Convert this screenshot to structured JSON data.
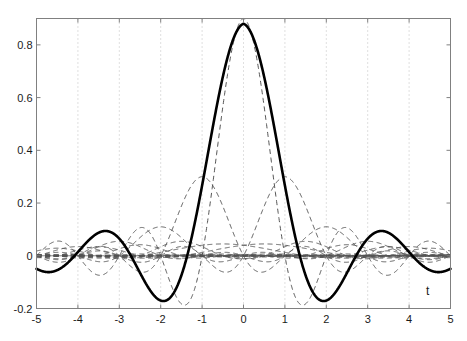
{
  "figure": {
    "background_color": "#ffffff",
    "width": 467,
    "height": 341
  },
  "chart_data": {
    "type": "line",
    "title": "",
    "subtitle": "",
    "xlabel": "t",
    "ylabel": "",
    "xlim": [
      -5,
      5
    ],
    "ylim": [
      -0.2,
      0.9
    ],
    "grid": true,
    "grid_style": "dotted",
    "grid_color": "#b0b0b0",
    "legend": null,
    "legend_position": "none",
    "axis_color": "#808080",
    "xticks": [
      -5,
      -4,
      -3,
      -2,
      -1,
      0,
      1,
      2,
      3,
      4,
      5
    ],
    "xtick_labels": [
      "-5",
      "-4",
      "-3",
      "-2",
      "-1",
      "0",
      "1",
      "2",
      "3",
      "4",
      "5"
    ],
    "yticks": [
      -0.2,
      0,
      0.2,
      0.4,
      0.6,
      0.8
    ],
    "ytick_labels": [
      "-0.2",
      "0",
      "0.2",
      "0.4",
      "0.6",
      "0.8"
    ],
    "annotations": [
      {
        "text": "t",
        "x": 4.45,
        "y": -0.135,
        "name": "x-axis-title"
      }
    ],
    "series": [
      {
        "name": "main-scaling-function",
        "style": "solid",
        "color": "#000000",
        "width": 2.6,
        "description": "Thick solid sinc-like scaling function, peak 0.88 at t=0, zero crossings near t=+-1.35, minima -0.16 at t=+-1.95, secondary maxima 0.063 at t=+-3.25",
        "peak_value": 0.88,
        "peak_x": 0,
        "minima": [
          {
            "x": -1.95,
            "y": -0.16
          },
          {
            "x": 1.95,
            "y": -0.16
          }
        ],
        "secondary_maxima": [
          {
            "x": -3.25,
            "y": 0.063
          },
          {
            "x": 3.25,
            "y": 0.063
          }
        ],
        "params": {
          "A": 0.88,
          "f": 0.672,
          "decay": 1.0
        }
      },
      {
        "name": "component-shift-0",
        "style": "dashed",
        "color": "#555555",
        "width": 1.0,
        "description": "Dashed sinc component centered at t=0, amplitude 0.90",
        "params": {
          "A": 0.9,
          "center": 0,
          "f": 1.0
        }
      },
      {
        "name": "component-shift-minus1",
        "style": "dashed",
        "color": "#555555",
        "width": 1.0,
        "description": "Dashed sinc component centered at t=-1, amplitude 0.30",
        "params": {
          "A": 0.3,
          "center": -1,
          "f": 1.0
        }
      },
      {
        "name": "component-shift-plus1",
        "style": "dashed",
        "color": "#555555",
        "width": 1.0,
        "description": "Dashed sinc component centered at t=1, amplitude 0.30",
        "params": {
          "A": 0.3,
          "center": 1,
          "f": 1.0
        }
      },
      {
        "name": "component-shift-minus2",
        "style": "dashed",
        "color": "#555555",
        "width": 1.0,
        "description": "Dashed sinc component centered at t=-2, amplitude 0.11",
        "params": {
          "A": 0.11,
          "center": -2,
          "f": 1.0
        }
      },
      {
        "name": "component-shift-plus2",
        "style": "dashed",
        "color": "#555555",
        "width": 1.0,
        "description": "Dashed sinc component centered at t=2, amplitude 0.11",
        "params": {
          "A": 0.11,
          "center": 2,
          "f": 1.0
        }
      },
      {
        "name": "component-shift-minus3",
        "style": "dashed",
        "color": "#555555",
        "width": 1.0,
        "description": "Dashed sinc component centered at t=-3, amplitude 0.055",
        "params": {
          "A": 0.055,
          "center": -3,
          "f": 1.0
        }
      },
      {
        "name": "component-shift-plus3",
        "style": "dashed",
        "color": "#555555",
        "width": 1.0,
        "description": "Dashed sinc component centered at t=3, amplitude 0.055",
        "params": {
          "A": 0.055,
          "center": 3,
          "f": 1.0
        }
      },
      {
        "name": "component-shift-minus4",
        "style": "dashed",
        "color": "#555555",
        "width": 1.0,
        "description": "Dashed sinc component centered at t=-4, amplitude 0.035",
        "params": {
          "A": 0.035,
          "center": -4,
          "f": 1.0
        }
      },
      {
        "name": "component-shift-plus4",
        "style": "dashed",
        "color": "#555555",
        "width": 1.0,
        "description": "Dashed sinc component centered at t=4, amplitude 0.035",
        "params": {
          "A": 0.035,
          "center": 4,
          "f": 1.0
        }
      },
      {
        "name": "component-wide-minus1",
        "style": "dashed",
        "color": "#555555",
        "width": 1.0,
        "description": "Broad low-amplitude dashed component, amplitude 0.045 centered t=-0.5",
        "params": {
          "A": 0.045,
          "center": -0.5,
          "f": 0.5
        }
      },
      {
        "name": "component-wide-plus1",
        "style": "dashed",
        "color": "#555555",
        "width": 1.0,
        "description": "Broad low-amplitude dashed component, amplitude 0.045 centered t=0.5",
        "params": {
          "A": 0.045,
          "center": 0.5,
          "f": 0.5
        }
      },
      {
        "name": "zero-baseline",
        "style": "solid",
        "color": "#777777",
        "width": 0.9,
        "description": "Horizontal baseline at y=0 spanning full x range",
        "params": {
          "y": 0
        }
      }
    ]
  }
}
